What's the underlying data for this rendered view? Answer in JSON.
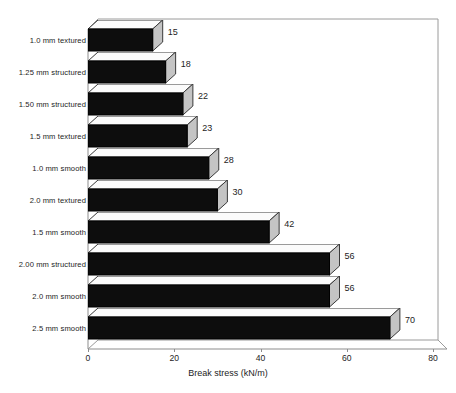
{
  "chart_data": {
    "type": "bar",
    "orientation": "horizontal",
    "title": "",
    "xlabel": "Break stress (kN/m)",
    "ylabel": "",
    "xlim": [
      0,
      80
    ],
    "xticks": [
      0,
      20,
      40,
      60,
      80
    ],
    "xtick_labels": [
      "0",
      "20",
      "40",
      "60",
      "80"
    ],
    "grid": false,
    "legend": null,
    "style": "3d-bar",
    "categories": [
      "1.0 mm textured",
      "1.25 mm structured",
      "1.50 mm structured",
      "1.5 mm textured",
      "1.0 mm smooth",
      "2.0 mm textured",
      "1.5 mm smooth",
      "2.00 mm structured",
      "2.0 mm smooth",
      "2.5 mm smooth"
    ],
    "values": [
      15,
      18,
      22,
      23,
      28,
      30,
      42,
      56,
      56,
      70
    ],
    "data_labels": [
      "15",
      "18",
      "22",
      "23",
      "28",
      "30",
      "42",
      "56",
      "56",
      "70"
    ],
    "colors": {
      "bar_front": "#0d0d0d",
      "bar_top": "#fbfbfb",
      "bar_side": "#c4c4c4",
      "axis": "#8d8d8d",
      "text": "#1d1d1d",
      "background": "#ffffff"
    }
  }
}
